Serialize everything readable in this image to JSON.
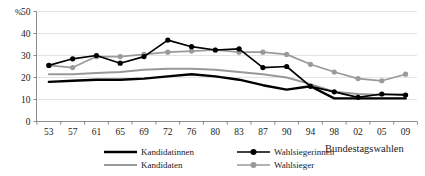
{
  "chart_data": {
    "type": "line",
    "title": "",
    "xlabel": "Bundestagswahlen",
    "ylabel": "%",
    "ylim": [
      0,
      50
    ],
    "yticks": [
      0,
      10,
      20,
      30,
      40,
      50
    ],
    "grid": true,
    "legend_position": "bottom",
    "categories": [
      "53",
      "57",
      "61",
      "65",
      "69",
      "72",
      "76",
      "80",
      "83",
      "87",
      "90",
      "94",
      "98",
      "02",
      "05",
      "09"
    ],
    "series": [
      {
        "name": "Kandidatinnen",
        "color": "#000000",
        "style": "thick-line-no-marker",
        "values": [
          18.0,
          18.5,
          19.0,
          19.0,
          19.5,
          20.5,
          21.5,
          20.5,
          19.0,
          16.5,
          14.5,
          16.0,
          10.5,
          10.5,
          10.5,
          10.5
        ]
      },
      {
        "name": "Kandidaten",
        "color": "#999999",
        "style": "medium-line-no-marker",
        "values": [
          21.5,
          21.5,
          22.0,
          22.5,
          23.5,
          24.0,
          24.0,
          23.5,
          22.5,
          21.5,
          20.0,
          17.0,
          13.5,
          12.5,
          12.0,
          12.5
        ]
      },
      {
        "name": "Wahlsiegerinnen",
        "color": "#000000",
        "style": "line-with-round-marker",
        "values": [
          25.5,
          28.5,
          30.0,
          26.5,
          29.5,
          37.0,
          34.0,
          32.5,
          33.0,
          24.5,
          25.0,
          16.0,
          13.5,
          11.0,
          12.5,
          12.0
        ]
      },
      {
        "name": "Wahlsieger",
        "color": "#9a9a9a",
        "style": "line-with-round-marker",
        "values": [
          25.5,
          24.5,
          29.5,
          29.5,
          30.5,
          31.5,
          32.0,
          32.5,
          31.5,
          31.5,
          30.5,
          26.0,
          22.5,
          19.5,
          18.5,
          21.5
        ]
      }
    ]
  },
  "legend": {
    "items": [
      {
        "label": "Kandidatinnen"
      },
      {
        "label": "Kandidaten"
      },
      {
        "label": "Wahlsiegerinnen"
      },
      {
        "label": "Wahlsieger"
      }
    ]
  }
}
